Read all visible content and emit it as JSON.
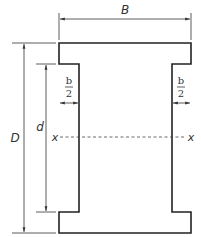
{
  "diagram": {
    "labels": {
      "flange_width": "B",
      "overall_depth": "D",
      "web_depth": "d",
      "half_b_num": "b",
      "half_b_den": "2",
      "axis_left": "x",
      "axis_right": "x"
    },
    "colors": {
      "outline": "#222222",
      "dimension": "#333333"
    }
  }
}
